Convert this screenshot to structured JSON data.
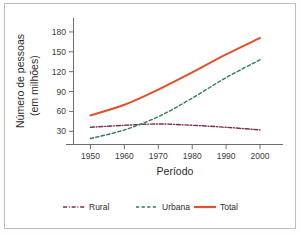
{
  "chart_data": {
    "type": "line",
    "title": "",
    "xlabel": "Período",
    "ylabel_line1": "Número de pessoas",
    "ylabel_line2": "(em milhões)",
    "x": [
      1950,
      1960,
      1970,
      1980,
      1990,
      2000
    ],
    "xlim": [
      1945,
      2005
    ],
    "ylim": [
      10,
      195
    ],
    "xticks": [
      "1950",
      "1960",
      "1970",
      "1980",
      "1990",
      "2000"
    ],
    "yticks": [
      "30",
      "60",
      "90",
      "120",
      "150",
      "180"
    ],
    "ytick_values": [
      30,
      60,
      90,
      120,
      150,
      180
    ],
    "grid": false,
    "legend_position": "bottom",
    "series": [
      {
        "name": "Rural",
        "color": "#7B2C47",
        "style": "dash-dot",
        "values": [
          36,
          39,
          41,
          39,
          36,
          32
        ]
      },
      {
        "name": "Urbana",
        "color": "#2E7D52",
        "style": "dashed",
        "values": [
          19,
          32,
          52,
          80,
          111,
          138
        ]
      },
      {
        "name": "Total",
        "color": "#E2502C",
        "style": "solid",
        "values": [
          54,
          70,
          93,
          119,
          146,
          171
        ]
      }
    ]
  },
  "legend": {
    "items": [
      {
        "label": "Rural",
        "color": "#7B2C47",
        "style": "dash-dot"
      },
      {
        "label": "Urbana",
        "color": "#2E7D52",
        "style": "dashed"
      },
      {
        "label": "Total",
        "color": "#E2502C",
        "style": "solid"
      }
    ]
  },
  "colors": {
    "rural": "#7B2C47",
    "urbana": "#2E7D52",
    "total": "#E2502C",
    "axis": "#6e6e6e",
    "text": "#2b2b2b",
    "frame": "#bdbdbd"
  }
}
